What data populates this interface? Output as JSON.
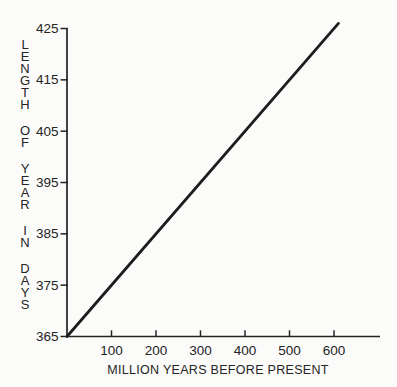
{
  "figure": {
    "background_color": "#fbfbfa",
    "ink_color": "#242424",
    "line_color": "#1d1d1d"
  },
  "chart_data": {
    "type": "line",
    "title": "",
    "xlabel": "MILLION YEARS BEFORE PRESENT",
    "ylabel": "LENGTH OF YEAR IN DAYS",
    "x_ticks": [
      100,
      200,
      300,
      400,
      500,
      600
    ],
    "y_ticks": [
      365,
      375,
      385,
      395,
      405,
      415,
      425
    ],
    "xlim": [
      0,
      700
    ],
    "ylim": [
      365,
      425
    ],
    "grid": false,
    "series": [
      {
        "name": "length-of-year-vs-time",
        "points": [
          [
            0,
            365
          ],
          [
            610,
            426
          ]
        ]
      }
    ]
  }
}
